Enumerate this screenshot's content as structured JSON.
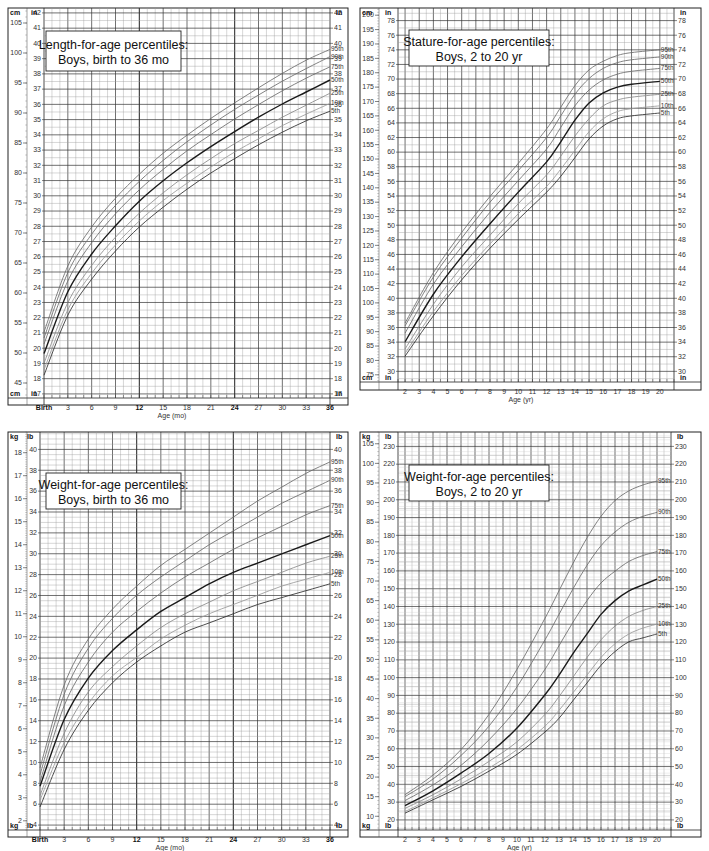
{
  "chart_data": [
    {
      "id": "length-0-36",
      "type": "line",
      "title": [
        "Length-for-age percentiles:",
        "Boys, birth to 36 mo"
      ],
      "xlabel": "Age (mo)",
      "left_unit": "cm",
      "right_unit": "in",
      "xlim": [
        0,
        36
      ],
      "x_ticks": [
        {
          "v": 0,
          "label": "Birth",
          "bold": true
        },
        {
          "v": 3,
          "label": "3"
        },
        {
          "v": 6,
          "label": "6"
        },
        {
          "v": 9,
          "label": "9"
        },
        {
          "v": 12,
          "label": "12",
          "bold": true
        },
        {
          "v": 15,
          "label": "15"
        },
        {
          "v": 18,
          "label": "18"
        },
        {
          "v": 21,
          "label": "21"
        },
        {
          "v": 24,
          "label": "24",
          "bold": true
        },
        {
          "v": 27,
          "label": "27"
        },
        {
          "v": 30,
          "label": "30"
        },
        {
          "v": 33,
          "label": "33"
        },
        {
          "v": 36,
          "label": "36",
          "bold": true
        }
      ],
      "ylim_cm": [
        42.5,
        107.5
      ],
      "left_ticks": [
        45,
        50,
        55,
        60,
        65,
        70,
        75,
        80,
        85,
        90,
        95,
        100,
        105
      ],
      "right_ticks": [
        17,
        18,
        19,
        20,
        21,
        22,
        23,
        24,
        25,
        26,
        27,
        28,
        29,
        30,
        31,
        32,
        33,
        34,
        35,
        36,
        37,
        38,
        39,
        40,
        41,
        42
      ],
      "right_scale": 2.54,
      "x": [
        0,
        3,
        6,
        9,
        12,
        15,
        18,
        21,
        24,
        27,
        30,
        33,
        36
      ],
      "series": [
        {
          "name": "95th",
          "values": [
            53.5,
            64.5,
            71.0,
            75.8,
            79.8,
            83.3,
            86.3,
            89.1,
            91.7,
            94.2,
            96.6,
            98.8,
            100.6
          ]
        },
        {
          "name": "90th",
          "values": [
            52.5,
            63.4,
            69.8,
            74.6,
            78.6,
            82.1,
            85.2,
            88.0,
            90.6,
            93.0,
            95.3,
            97.4,
            99.4
          ]
        },
        {
          "name": "75th",
          "values": [
            51.5,
            62.0,
            68.4,
            73.2,
            77.2,
            80.6,
            83.7,
            86.4,
            89.0,
            91.4,
            93.7,
            95.8,
            97.7
          ]
        },
        {
          "name": "50th",
          "values": [
            49.9,
            60.2,
            66.5,
            71.2,
            75.3,
            78.7,
            81.7,
            84.4,
            86.9,
            89.3,
            91.5,
            93.5,
            95.5
          ]
        },
        {
          "name": "25th",
          "values": [
            48.3,
            58.4,
            64.6,
            69.3,
            73.3,
            76.7,
            79.7,
            82.4,
            84.9,
            87.1,
            89.3,
            91.3,
            93.3
          ]
        },
        {
          "name": "10th",
          "values": [
            47.2,
            57.2,
            63.3,
            68.0,
            72.0,
            75.4,
            78.3,
            81.0,
            83.5,
            85.7,
            87.9,
            89.8,
            91.6
          ]
        },
        {
          "name": "5th",
          "values": [
            46.3,
            56.3,
            62.3,
            67.0,
            71.0,
            74.3,
            77.3,
            80.0,
            82.4,
            84.7,
            86.8,
            88.7,
            90.3
          ]
        }
      ],
      "legend": "right-end labels"
    },
    {
      "id": "stature-2-20",
      "type": "line",
      "title": [
        "Stature-for-age percentiles:",
        "Boys, 2 to 20 yr"
      ],
      "xlabel": "Age (yr)",
      "left_unit": "cm",
      "right_unit": "in",
      "xlim": [
        1.5,
        21
      ],
      "x_ticks": [
        {
          "v": 2,
          "label": "2"
        },
        {
          "v": 3,
          "label": "3"
        },
        {
          "v": 4,
          "label": "4"
        },
        {
          "v": 5,
          "label": "5"
        },
        {
          "v": 6,
          "label": "6"
        },
        {
          "v": 7,
          "label": "7"
        },
        {
          "v": 8,
          "label": "8"
        },
        {
          "v": 9,
          "label": "9"
        },
        {
          "v": 10,
          "label": "10"
        },
        {
          "v": 11,
          "label": "11"
        },
        {
          "v": 12,
          "label": "12"
        },
        {
          "v": 13,
          "label": "13"
        },
        {
          "v": 14,
          "label": "14"
        },
        {
          "v": 15,
          "label": "15"
        },
        {
          "v": 16,
          "label": "16"
        },
        {
          "v": 17,
          "label": "17"
        },
        {
          "v": 18,
          "label": "18"
        },
        {
          "v": 19,
          "label": "19"
        },
        {
          "v": 20,
          "label": "20"
        }
      ],
      "ylim_cm": [
        72.5,
        202.5
      ],
      "left_ticks": [
        75,
        80,
        85,
        90,
        95,
        100,
        105,
        110,
        115,
        120,
        125,
        130,
        135,
        140,
        145,
        150,
        155,
        160,
        165,
        170,
        175,
        180,
        185,
        190,
        195,
        200
      ],
      "right_ticks": [
        30,
        32,
        34,
        36,
        38,
        40,
        42,
        44,
        46,
        48,
        50,
        52,
        54,
        56,
        58,
        60,
        62,
        64,
        66,
        68,
        70,
        72,
        74,
        76,
        78
      ],
      "right_scale": 2.54,
      "x": [
        2,
        4,
        6,
        8,
        10,
        12,
        13,
        14,
        15,
        16,
        17,
        18,
        20
      ],
      "series": [
        {
          "name": "95th",
          "values": [
            93.0,
            110.5,
            124.5,
            137.0,
            148.5,
            160.5,
            168.0,
            175.5,
            181.0,
            184.0,
            186.0,
            187.0,
            188.0
          ]
        },
        {
          "name": "90th",
          "values": [
            92.0,
            109.0,
            122.5,
            135.0,
            146.0,
            157.5,
            165.0,
            172.5,
            178.0,
            181.5,
            183.5,
            184.5,
            185.5
          ]
        },
        {
          "name": "75th",
          "values": [
            89.5,
            106.5,
            119.5,
            131.5,
            142.5,
            153.5,
            161.0,
            168.5,
            174.0,
            177.5,
            179.5,
            180.5,
            181.5
          ]
        },
        {
          "name": "50th",
          "values": [
            86.5,
            103.0,
            116.0,
            127.5,
            138.5,
            149.0,
            156.0,
            163.5,
            169.5,
            173.0,
            175.0,
            176.0,
            177.0
          ]
        },
        {
          "name": "25th",
          "values": [
            84.0,
            99.5,
            112.5,
            123.5,
            134.5,
            144.5,
            151.0,
            158.0,
            164.0,
            168.5,
            170.5,
            171.5,
            172.5
          ]
        },
        {
          "name": "10th",
          "values": [
            82.5,
            97.0,
            109.5,
            120.5,
            131.0,
            140.5,
            146.5,
            153.0,
            159.5,
            164.0,
            166.5,
            167.5,
            168.5
          ]
        },
        {
          "name": "5th",
          "values": [
            81.5,
            95.5,
            108.0,
            119.0,
            129.0,
            138.5,
            144.0,
            150.5,
            157.0,
            161.5,
            164.0,
            165.0,
            166.0
          ]
        }
      ],
      "legend": "right-end labels"
    },
    {
      "id": "weight-0-36",
      "type": "line",
      "title": [
        "Weight-for-age percentiles:",
        "Boys, birth to 36 mo"
      ],
      "xlabel": "Age (mo)",
      "left_unit": "kg",
      "right_unit": "lb",
      "xlim": [
        0,
        36
      ],
      "x_ticks": [
        {
          "v": 0,
          "label": "Birth",
          "bold": true
        },
        {
          "v": 3,
          "label": "3"
        },
        {
          "v": 6,
          "label": "6"
        },
        {
          "v": 9,
          "label": "9"
        },
        {
          "v": 12,
          "label": "12",
          "bold": true
        },
        {
          "v": 15,
          "label": "15"
        },
        {
          "v": 18,
          "label": "18"
        },
        {
          "v": 21,
          "label": "21"
        },
        {
          "v": 24,
          "label": "24",
          "bold": true
        },
        {
          "v": 27,
          "label": "27"
        },
        {
          "v": 30,
          "label": "30"
        },
        {
          "v": 33,
          "label": "33"
        },
        {
          "v": 36,
          "label": "36",
          "bold": true
        }
      ],
      "ylim_kg": [
        1.6,
        18.9
      ],
      "left_ticks": [
        2,
        3,
        4,
        5,
        6,
        7,
        8,
        9,
        10,
        11,
        12,
        13,
        14,
        15,
        16,
        17,
        18
      ],
      "right_ticks": [
        4,
        6,
        8,
        10,
        12,
        14,
        16,
        18,
        20,
        22,
        24,
        26,
        28,
        30,
        32,
        34,
        36,
        38,
        40
      ],
      "right_scale": 0.4536,
      "x": [
        0,
        3,
        6,
        9,
        12,
        15,
        18,
        21,
        24,
        27,
        30,
        33,
        36
      ],
      "series": [
        {
          "name": "95th",
          "values": [
            4.3,
            7.9,
            9.9,
            11.2,
            12.2,
            13.1,
            13.8,
            14.5,
            15.2,
            15.9,
            16.5,
            17.1,
            17.6
          ]
        },
        {
          "name": "90th",
          "values": [
            4.0,
            7.5,
            9.5,
            10.8,
            11.8,
            12.6,
            13.3,
            14.0,
            14.6,
            15.2,
            15.8,
            16.3,
            16.8
          ]
        },
        {
          "name": "75th",
          "values": [
            3.7,
            7.0,
            8.9,
            10.2,
            11.1,
            11.9,
            12.6,
            13.2,
            13.8,
            14.3,
            14.8,
            15.3,
            15.7
          ]
        },
        {
          "name": "50th",
          "values": [
            3.5,
            6.4,
            8.2,
            9.4,
            10.3,
            11.1,
            11.7,
            12.3,
            12.8,
            13.2,
            13.6,
            14.0,
            14.4
          ]
        },
        {
          "name": "25th",
          "values": [
            3.1,
            5.8,
            7.6,
            8.7,
            9.6,
            10.4,
            11.0,
            11.5,
            12.0,
            12.4,
            12.8,
            13.2,
            13.5
          ]
        },
        {
          "name": "10th",
          "values": [
            2.9,
            5.4,
            7.1,
            8.3,
            9.1,
            9.9,
            10.5,
            11.0,
            11.4,
            11.8,
            12.2,
            12.5,
            12.8
          ]
        },
        {
          "name": "5th",
          "values": [
            2.6,
            5.1,
            6.8,
            8.0,
            8.9,
            9.6,
            10.2,
            10.6,
            11.0,
            11.4,
            11.7,
            12.0,
            12.3
          ]
        }
      ],
      "legend": "right-end labels"
    },
    {
      "id": "weight-2-20",
      "type": "line",
      "title": [
        "Weight-for-age percentiles:",
        "Boys, 2 to 20 yr"
      ],
      "xlabel": "Age (yr)",
      "left_unit": "kg",
      "right_unit": "lb",
      "xlim": [
        1.5,
        21
      ],
      "x_ticks": [
        {
          "v": 2,
          "label": "2"
        },
        {
          "v": 3,
          "label": "3"
        },
        {
          "v": 4,
          "label": "4"
        },
        {
          "v": 5,
          "label": "5"
        },
        {
          "v": 6,
          "label": "6"
        },
        {
          "v": 7,
          "label": "7"
        },
        {
          "v": 8,
          "label": "8"
        },
        {
          "v": 9,
          "label": "9"
        },
        {
          "v": 10,
          "label": "10"
        },
        {
          "v": 11,
          "label": "11"
        },
        {
          "v": 12,
          "label": "12"
        },
        {
          "v": 13,
          "label": "13"
        },
        {
          "v": 14,
          "label": "14"
        },
        {
          "v": 15,
          "label": "15"
        },
        {
          "v": 16,
          "label": "16"
        },
        {
          "v": 17,
          "label": "17"
        },
        {
          "v": 18,
          "label": "18"
        },
        {
          "v": 19,
          "label": "19"
        },
        {
          "v": 20,
          "label": "20"
        }
      ],
      "ylim_kg": [
        6.5,
        108
      ],
      "left_ticks": [
        10,
        15,
        20,
        25,
        30,
        35,
        40,
        45,
        50,
        55,
        60,
        65,
        70,
        75,
        80,
        85,
        90,
        95,
        100,
        105
      ],
      "right_ticks": [
        20,
        30,
        40,
        50,
        60,
        70,
        80,
        90,
        100,
        110,
        120,
        130,
        140,
        150,
        160,
        170,
        180,
        190,
        200,
        210,
        220,
        230
      ],
      "right_scale": 0.4536,
      "x": [
        2,
        4,
        6,
        8,
        10,
        12,
        13,
        14,
        15,
        16,
        17,
        18,
        19,
        20
      ],
      "series": [
        {
          "name": "95th",
          "values": [
            15.5,
            20.5,
            27.0,
            36.0,
            47.5,
            60.5,
            67.5,
            74.5,
            81.0,
            86.5,
            90.5,
            93.0,
            94.5,
            95.5
          ]
        },
        {
          "name": "90th",
          "values": [
            15.0,
            19.5,
            25.5,
            33.0,
            43.0,
            55.0,
            61.5,
            68.0,
            74.0,
            79.0,
            82.5,
            85.0,
            86.5,
            87.5
          ]
        },
        {
          "name": "75th",
          "values": [
            14.0,
            18.0,
            23.0,
            29.5,
            37.5,
            47.5,
            53.5,
            59.5,
            65.0,
            69.5,
            72.5,
            75.0,
            76.5,
            77.5
          ]
        },
        {
          "name": "50th",
          "values": [
            12.7,
            16.5,
            21.0,
            26.0,
            32.5,
            41.0,
            46.0,
            51.5,
            56.5,
            61.5,
            65.0,
            67.5,
            69.0,
            70.5
          ]
        },
        {
          "name": "25th",
          "values": [
            12.0,
            15.5,
            19.5,
            24.0,
            29.0,
            36.0,
            40.5,
            45.5,
            50.5,
            55.0,
            58.5,
            61.0,
            62.5,
            63.5
          ]
        },
        {
          "name": "10th",
          "values": [
            11.2,
            14.7,
            18.3,
            22.3,
            27.0,
            33.0,
            37.0,
            41.5,
            46.0,
            50.5,
            54.0,
            56.5,
            58.0,
            59.0
          ]
        },
        {
          "name": "5th",
          "values": [
            10.8,
            14.2,
            17.6,
            21.5,
            25.8,
            31.5,
            35.0,
            39.5,
            44.0,
            48.5,
            52.0,
            54.5,
            55.5,
            56.5
          ]
        }
      ],
      "legend": "right-end labels"
    }
  ],
  "styles": {
    "grid_major": "#333333",
    "grid_minor": "#9a9a9a",
    "curve_colors": {
      "95th": "#6b6b6b",
      "90th": "#6b6b6b",
      "75th": "#6b6b6b",
      "50th": "#1a1a1a",
      "25th": "#8a8a8a",
      "10th": "#9a9a9a",
      "5th": "#2e2e2e"
    }
  }
}
